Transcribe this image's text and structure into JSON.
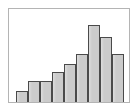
{
  "figure": {
    "name": "histogram-thumbnail",
    "width_px": 139,
    "height_px": 111,
    "background_color": "#ffffff",
    "frame_color": "#b4b4b4",
    "frame_left_px": 8,
    "frame_top_px": 8,
    "frame_width_px": 122,
    "frame_height_px": 95
  },
  "style": {
    "bar_fill": "#cbcbcb",
    "bar_stroke": "#4a4a4a",
    "bar_stroke_width_px": 1,
    "bar_width_px": 12,
    "bar_gap_px": 0
  },
  "chart_data": {
    "type": "bar",
    "title": "",
    "subtitle": "",
    "xlabel": "",
    "ylabel": "",
    "legend": [],
    "legend_position": "none",
    "grid": false,
    "axis_ticks": false,
    "tick_labels_x": [],
    "tick_labels_y": [],
    "annotations": [],
    "categories": [
      "1",
      "2",
      "3",
      "4",
      "5",
      "6",
      "7",
      "8",
      "9"
    ],
    "values": [
      11,
      21,
      21,
      30,
      38,
      48,
      77,
      65,
      48
    ],
    "ylim": [
      0,
      95
    ],
    "xlim": [
      0,
      9
    ]
  }
}
